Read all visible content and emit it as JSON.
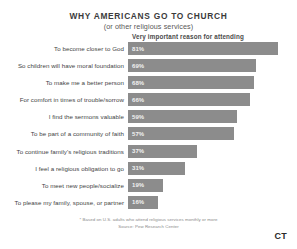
{
  "chart_data": {
    "type": "bar",
    "orientation": "horizontal",
    "title": "WHY AMERICANS GO TO CHURCH",
    "subtitle": "(or other religious services)",
    "column_header": "Very important reason for attending",
    "xlabel": "",
    "ylabel": "",
    "xlim": [
      0,
      100
    ],
    "grid": false,
    "legend": null,
    "bar_color": "#8c8c8c",
    "value_suffix": "%",
    "categories": [
      "To become closer to God",
      "So children will have moral foundation",
      "To make me a better person",
      "For comfort in times of trouble/sorrow",
      "I find the sermons valuable",
      "To be part of a community of faith",
      "To continue family's religious traditions",
      "I feel a religious obligation to go",
      "To meet new people/socialize",
      "To please my family, spouse, or partner"
    ],
    "values": [
      81,
      69,
      68,
      66,
      59,
      57,
      37,
      31,
      19,
      16
    ],
    "value_labels": [
      "81%",
      "69%",
      "68%",
      "66%",
      "59%",
      "57%",
      "37%",
      "31%",
      "19%",
      "16%"
    ],
    "footnote": "* Based on U.S. adults who attend religious services monthly or more",
    "source": "Source: Pew Research Center"
  },
  "branding": {
    "logo_text": "CT"
  }
}
